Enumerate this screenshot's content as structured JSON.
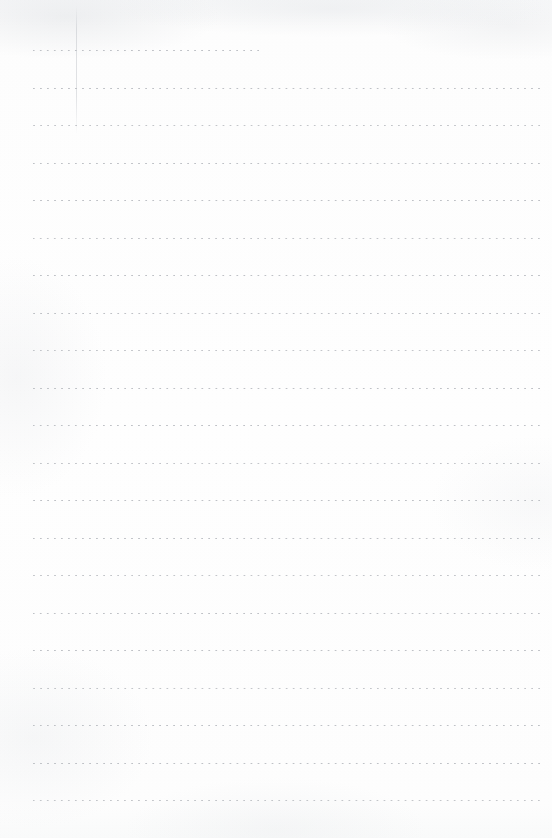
{
  "document": {
    "kind": "scanned-notepad-page",
    "title": "Blank ruled notepad page",
    "page_width": 552,
    "page_height": 838,
    "paper_color": "#fdfdfd",
    "rule_color": "#b9bcc1",
    "margin_rule_color": "#c4c7cc",
    "text_content": "",
    "rule_style": "dotted",
    "dot_pitch": 7,
    "line_spacing": 37.5,
    "left_margin_x": 33,
    "right_margin_x": 542,
    "margin_rule": {
      "x": 76,
      "top": 6,
      "height": 128,
      "visible": true
    },
    "lines": [
      {
        "y": 50,
        "x_start": 33,
        "x_end": 262,
        "opacity": "normal"
      },
      {
        "y": 88,
        "x_start": 33,
        "x_end": 542,
        "opacity": "normal"
      },
      {
        "y": 125,
        "x_start": 33,
        "x_end": 542,
        "opacity": "soft"
      },
      {
        "y": 163,
        "x_start": 33,
        "x_end": 542,
        "opacity": "normal"
      },
      {
        "y": 200,
        "x_start": 33,
        "x_end": 542,
        "opacity": "normal"
      },
      {
        "y": 238,
        "x_start": 33,
        "x_end": 542,
        "opacity": "soft"
      },
      {
        "y": 275,
        "x_start": 33,
        "x_end": 542,
        "opacity": "normal"
      },
      {
        "y": 313,
        "x_start": 33,
        "x_end": 542,
        "opacity": "normal"
      },
      {
        "y": 350,
        "x_start": 33,
        "x_end": 542,
        "opacity": "soft"
      },
      {
        "y": 388,
        "x_start": 33,
        "x_end": 542,
        "opacity": "normal"
      },
      {
        "y": 425,
        "x_start": 33,
        "x_end": 542,
        "opacity": "normal"
      },
      {
        "y": 463,
        "x_start": 33,
        "x_end": 542,
        "opacity": "soft"
      },
      {
        "y": 500,
        "x_start": 33,
        "x_end": 542,
        "opacity": "normal"
      },
      {
        "y": 538,
        "x_start": 33,
        "x_end": 542,
        "opacity": "normal"
      },
      {
        "y": 575,
        "x_start": 33,
        "x_end": 542,
        "opacity": "soft"
      },
      {
        "y": 613,
        "x_start": 33,
        "x_end": 542,
        "opacity": "normal"
      },
      {
        "y": 650,
        "x_start": 33,
        "x_end": 542,
        "opacity": "normal"
      },
      {
        "y": 688,
        "x_start": 33,
        "x_end": 542,
        "opacity": "soft"
      },
      {
        "y": 725,
        "x_start": 33,
        "x_end": 542,
        "opacity": "normal"
      },
      {
        "y": 763,
        "x_start": 33,
        "x_end": 542,
        "opacity": "normal"
      },
      {
        "y": 800,
        "x_start": 33,
        "x_end": 542,
        "opacity": "soft"
      }
    ]
  }
}
